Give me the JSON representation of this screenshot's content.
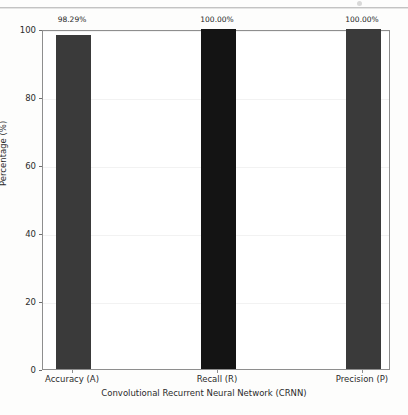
{
  "chart_data": {
    "type": "bar",
    "title": "",
    "categories": [
      "Accuracy (A)",
      "Recall (R)",
      "Precision (P)"
    ],
    "values": [
      98.29,
      100.0,
      100.0
    ],
    "value_labels": [
      "98.29%",
      "100.00%",
      "100.00%"
    ],
    "series": [
      {
        "name": "Convolutional Recurrent Neural Network (CRNN)",
        "values": [
          98.29,
          100.0,
          100.0
        ]
      }
    ],
    "xlabel": "Convolutional Recurrent Neural Network (CRNN)",
    "ylabel": "Percentage (%)",
    "ylim": [
      0,
      100
    ],
    "yticks": [
      0,
      20,
      40,
      60,
      80,
      100
    ],
    "ytick_labels": [
      "0",
      "20",
      "40",
      "60",
      "80",
      "100"
    ],
    "grid": true,
    "legend": false,
    "bar_colors": [
      "#3a3a3a",
      "#141414",
      "#3a3a3a"
    ],
    "bar_width_px": 35,
    "bar_centers_px": [
      72,
      217,
      362
    ]
  },
  "colors": {
    "figure_background": "#fdfdfc",
    "axes_background": "#ffffff",
    "axes_edge": "#8e8e8e",
    "gridline": "#f2f2f2",
    "text": "#2b2b2b",
    "bar_dark_gray": "#3a3a3a",
    "bar_near_black": "#141414",
    "scan_artifact": "#b9b9b9"
  }
}
